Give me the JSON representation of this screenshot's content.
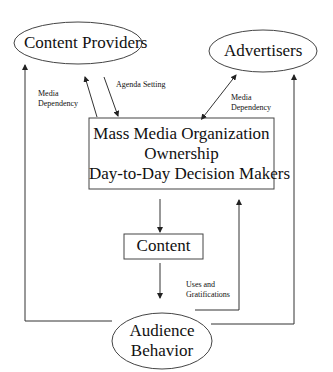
{
  "diagram": {
    "nodes": {
      "content_providers": {
        "label": "Content Providers",
        "shape": "ellipse"
      },
      "advertisers": {
        "label": "Advertisers",
        "shape": "ellipse"
      },
      "organization": {
        "shape": "rectangle",
        "lines": [
          "Mass Media Organization",
          "Ownership",
          "Day-to-Day Decision Makers"
        ]
      },
      "content": {
        "label": "Content",
        "shape": "rectangle"
      },
      "audience": {
        "shape": "ellipse",
        "lines": [
          "Audience",
          "Behavior"
        ]
      }
    },
    "edge_labels": {
      "media_dependency_left": [
        "Media",
        "Dependency"
      ],
      "agenda_setting": "Agenda Setting",
      "media_dependency_right": [
        "Media",
        "Dependency"
      ],
      "uses_gratifications": [
        "Uses and",
        "Gratifications"
      ]
    },
    "colors": {
      "line": "#333333",
      "text": "#111111",
      "background": "#ffffff"
    }
  }
}
